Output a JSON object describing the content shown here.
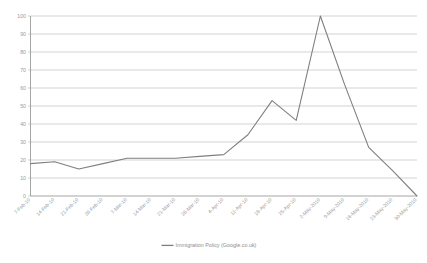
{
  "chart_data": {
    "type": "line",
    "title": "",
    "xlabel": "",
    "ylabel": "",
    "ylim": [
      0,
      100
    ],
    "yticks": [
      0,
      10,
      20,
      30,
      40,
      50,
      60,
      70,
      80,
      90,
      100
    ],
    "grid": true,
    "legend_position": "bottom",
    "categories": [
      "7-Feb-10",
      "14-Feb-10",
      "21-Feb-10",
      "28-Feb-10",
      "7-Mar-10",
      "14-Mar-10",
      "21-Mar-10",
      "28-Mar-10",
      "4-Apr-10",
      "11-Apr-10",
      "18-Apr-10",
      "25-Apr-10",
      "2-May-2010",
      "9-May-2010",
      "16-May-2010",
      "23-May-2010",
      "30-May-2010"
    ],
    "series": [
      {
        "name": "Immigration Policy (Google.co.uk)",
        "color": "#7f7f7f",
        "values": [
          18,
          19,
          15,
          18,
          21,
          21,
          21,
          22,
          23,
          34,
          53,
          42,
          100,
          62,
          27,
          14,
          0
        ]
      }
    ]
  },
  "legend": {
    "entries": [
      {
        "label": "Immigration Policy (Google.co.uk)",
        "color": "#7f7f7f"
      }
    ]
  },
  "axes": {
    "y_tick_labels": [
      "0",
      "10",
      "20",
      "30",
      "40",
      "50",
      "60",
      "70",
      "80",
      "90",
      "100"
    ],
    "x_tick_labels": [
      "7-Feb-10",
      "14-Feb-10",
      "21-Feb-10",
      "28-Feb-10",
      "7-Mar-10",
      "14-Mar-10",
      "21-Mar-10",
      "28-Mar-10",
      "4-Apr-10",
      "11-Apr-10",
      "18-Apr-10",
      "25-Apr-10",
      "2-May-2010",
      "9-May-2010",
      "16-May-2010",
      "23-May-2010",
      "30-May-2010"
    ]
  },
  "style": {
    "line_color": "#7f7f7f",
    "grid_color": "#a6a6a6",
    "axis_color": "#8f8f8f",
    "label_color": "#9a9a9a",
    "background": "#ffffff"
  }
}
